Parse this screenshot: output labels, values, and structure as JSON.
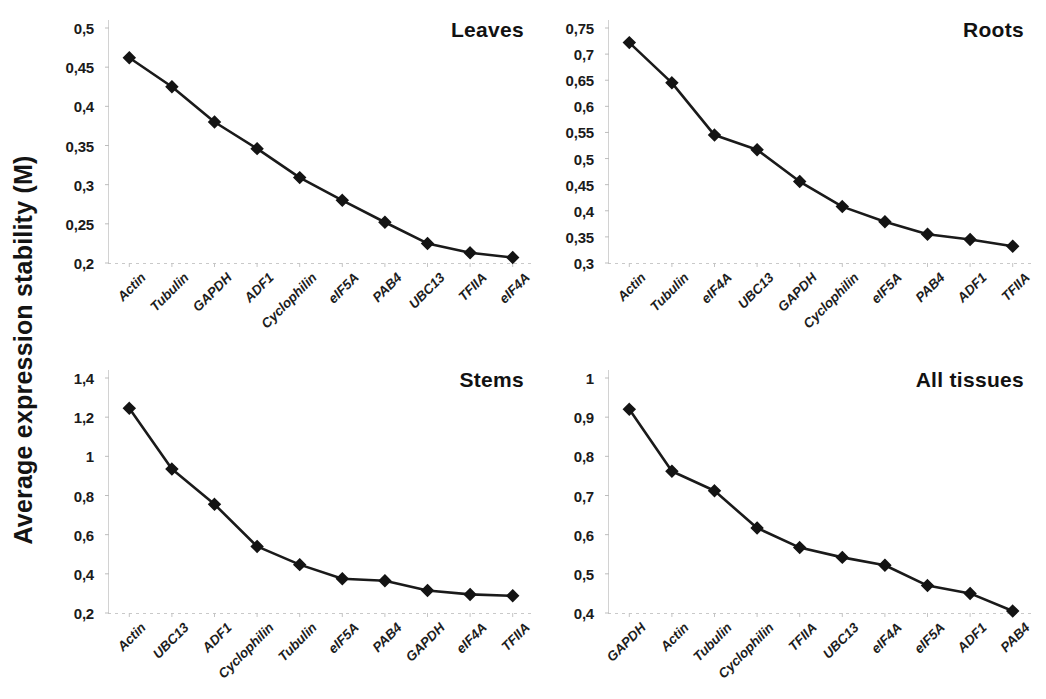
{
  "figure": {
    "y_axis_title": "Average expression stability (M)",
    "marker": "diamond-marker",
    "line_color": "#1a1a1a",
    "marker_color": "#141414",
    "background": "#ffffff"
  },
  "chart_data": [
    {
      "type": "line",
      "title": "Leaves",
      "xlabel": "",
      "ylabel": "Average expression stability (M)",
      "categories": [
        "Actin",
        "Tubulin",
        "GAPDH",
        "ADF1",
        "Cyclophilin",
        "eIF5A",
        "PAB4",
        "UBC13",
        "TFIIA",
        "eIF4A"
      ],
      "values": [
        0.462,
        0.425,
        0.38,
        0.346,
        0.309,
        0.28,
        0.252,
        0.225,
        0.213,
        0.207
      ],
      "ylim": [
        0.2,
        0.5
      ],
      "ytick_step": 0.05,
      "ytick_labels": [
        "0,5",
        "0,45",
        "0,4",
        "0,35",
        "0,3",
        "0,25",
        "0,2"
      ],
      "ytick_values": [
        0.5,
        0.45,
        0.4,
        0.35,
        0.3,
        0.25,
        0.2
      ],
      "grid": false,
      "legend": "none"
    },
    {
      "type": "line",
      "title": "Roots",
      "xlabel": "",
      "ylabel": "Average expression stability (M)",
      "categories": [
        "Actin",
        "Tubulin",
        "eIF4A",
        "UBC13",
        "GAPDH",
        "Cyclophilin",
        "eIF5A",
        "PAB4",
        "ADF1",
        "TFIIA"
      ],
      "values": [
        0.722,
        0.645,
        0.545,
        0.517,
        0.456,
        0.408,
        0.379,
        0.355,
        0.345,
        0.332
      ],
      "ylim": [
        0.3,
        0.75
      ],
      "ytick_step": 0.05,
      "ytick_labels": [
        "0,75",
        "0,7",
        "0,65",
        "0,6",
        "0,55",
        "0,5",
        "0,45",
        "0,4",
        "0,35",
        "0,3"
      ],
      "ytick_values": [
        0.75,
        0.7,
        0.65,
        0.6,
        0.55,
        0.5,
        0.45,
        0.4,
        0.35,
        0.3
      ],
      "grid": false,
      "legend": "none"
    },
    {
      "type": "line",
      "title": "Stems",
      "xlabel": "",
      "ylabel": "Average expression stability (M)",
      "categories": [
        "Actin",
        "UBC13",
        "ADF1",
        "Cyclophilin",
        "Tubulin",
        "eIF5A",
        "PAB4",
        "GAPDH",
        "eIF4A",
        "TFIIA"
      ],
      "values": [
        1.245,
        0.935,
        0.755,
        0.54,
        0.447,
        0.375,
        0.365,
        0.315,
        0.295,
        0.288
      ],
      "ylim": [
        0.2,
        1.4
      ],
      "ytick_step": 0.2,
      "ytick_labels": [
        "1,4",
        "1,2",
        "1",
        "0,8",
        "0,6",
        "0,4",
        "0,2"
      ],
      "ytick_values": [
        1.4,
        1.2,
        1.0,
        0.8,
        0.6,
        0.4,
        0.2
      ],
      "grid": false,
      "legend": "none"
    },
    {
      "type": "line",
      "title": "All tissues",
      "xlabel": "",
      "ylabel": "Average expression stability (M)",
      "categories": [
        "GAPDH",
        "Actin",
        "Tubulin",
        "Cyclophilin",
        "TFIIA",
        "UBC13",
        "eIF4A",
        "eIF5A",
        "ADF1",
        "PAB4"
      ],
      "values": [
        0.92,
        0.762,
        0.712,
        0.617,
        0.567,
        0.542,
        0.522,
        0.47,
        0.45,
        0.405
      ],
      "ylim": [
        0.4,
        1.0
      ],
      "ytick_step": 0.1,
      "ytick_labels": [
        "1",
        "0,9",
        "0,8",
        "0,7",
        "0,6",
        "0,5",
        "0,4"
      ],
      "ytick_values": [
        1.0,
        0.9,
        0.8,
        0.7,
        0.6,
        0.5,
        0.4
      ],
      "grid": false,
      "legend": "none"
    }
  ]
}
